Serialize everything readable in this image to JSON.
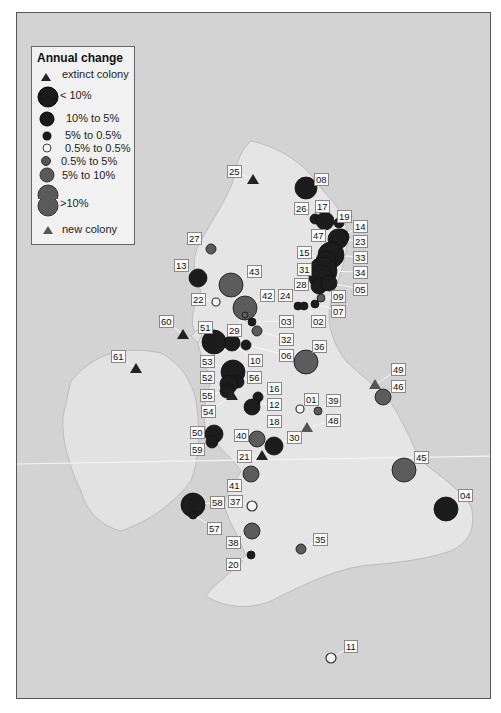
{
  "legend": {
    "title": "Annual change",
    "items": [
      {
        "label": "extinct colony",
        "symbol": "triangle",
        "color": "#222222"
      },
      {
        "label": "< 10%",
        "symbol": "circle",
        "size": 18,
        "color": "#1a1a1a"
      },
      {
        "label": "10% to  5%",
        "symbol": "circle",
        "size": 13,
        "color": "#1a1a1a"
      },
      {
        "label": "5% to  0.5%",
        "symbol": "circle",
        "size": 8,
        "color": "#1a1a1a"
      },
      {
        "label": "0.5% to 0.5%",
        "symbol": "circle",
        "size": 8,
        "color": "#ffffff"
      },
      {
        "label": "0.5% to 5%",
        "symbol": "circle",
        "size": 8,
        "color": "#555555"
      },
      {
        "label": "5% to 10%",
        "symbol": "circle",
        "size": 13,
        "color": "#555555"
      },
      {
        "label": ">10%",
        "symbol": "circle",
        "size": 18,
        "color": "#555555"
      },
      {
        "label": "new colony",
        "symbol": "triangle",
        "color": "#555555"
      }
    ]
  },
  "colonies": [
    {
      "id": "08",
      "x": 305,
      "y": 187,
      "r": 11,
      "cls": "dark",
      "lx": 313,
      "ly": 172
    },
    {
      "id": "25",
      "x": 252,
      "y": 179,
      "cls": "tri-dark",
      "lx": 226,
      "ly": 164
    },
    {
      "id": "26",
      "x": 314,
      "y": 218,
      "r": 5,
      "cls": "dark",
      "lx": 293,
      "ly": 201
    },
    {
      "id": "17",
      "x": 324,
      "y": 220,
      "r": 9,
      "cls": "dark",
      "lx": 314,
      "ly": 199
    },
    {
      "id": "19",
      "x": 338,
      "y": 222,
      "r": 5,
      "cls": "dark",
      "lx": 336,
      "ly": 209
    },
    {
      "id": "14",
      "x": 340,
      "y": 236,
      "r": 8,
      "cls": "dark",
      "lx": 352,
      "ly": 219
    },
    {
      "id": "47",
      "x": 320,
      "y": 236,
      "r": 3,
      "cls": "dark",
      "lx": 310,
      "ly": 228
    },
    {
      "id": "23",
      "x": 337,
      "y": 238,
      "r": 10,
      "cls": "dark",
      "lx": 352,
      "ly": 234
    },
    {
      "id": "33",
      "x": 330,
      "y": 254,
      "r": 13,
      "cls": "dark",
      "lx": 352,
      "ly": 250
    },
    {
      "id": "15",
      "x": 325,
      "y": 260,
      "r": 10,
      "cls": "dark",
      "lx": 296,
      "ly": 245
    },
    {
      "id": "34",
      "x": 322,
      "y": 270,
      "r": 14,
      "cls": "dark",
      "lx": 352,
      "ly": 265
    },
    {
      "id": "31",
      "x": 320,
      "y": 276,
      "r": 12,
      "cls": "dark",
      "lx": 296,
      "ly": 262
    },
    {
      "id": "28",
      "x": 318,
      "y": 285,
      "r": 8,
      "cls": "dark",
      "lx": 293,
      "ly": 277
    },
    {
      "id": "05",
      "x": 328,
      "y": 282,
      "r": 8,
      "cls": "dark",
      "lx": 352,
      "ly": 282
    },
    {
      "id": "09",
      "x": 320,
      "y": 297,
      "r": 4,
      "cls": "grey",
      "lx": 330,
      "ly": 289
    },
    {
      "id": "07",
      "x": 314,
      "y": 303,
      "r": 4,
      "cls": "dark",
      "lx": 330,
      "ly": 304
    },
    {
      "id": "24",
      "x": 297,
      "y": 305,
      "r": 4,
      "cls": "dark",
      "lx": 277,
      "ly": 288
    },
    {
      "id": "02",
      "x": 303,
      "y": 305,
      "r": 4,
      "cls": "dark",
      "lx": 310,
      "ly": 314
    },
    {
      "id": "27",
      "x": 210,
      "y": 248,
      "r": 5,
      "cls": "grey",
      "lx": 186,
      "ly": 231
    },
    {
      "id": "13",
      "x": 197,
      "y": 277,
      "r": 9,
      "cls": "dark",
      "lx": 173,
      "ly": 258
    },
    {
      "id": "43",
      "x": 230,
      "y": 284,
      "r": 12,
      "cls": "grey",
      "lx": 246,
      "ly": 264
    },
    {
      "id": "22",
      "x": 215,
      "y": 301,
      "r": 4,
      "cls": "white",
      "lx": 190,
      "ly": 292
    },
    {
      "id": "42",
      "x": 244,
      "y": 307,
      "r": 12,
      "cls": "grey",
      "lx": 259,
      "ly": 288
    },
    {
      "id": "29",
      "x": 244,
      "y": 314,
      "r": 3,
      "cls": "grey",
      "lx": 226,
      "ly": 323
    },
    {
      "id": "03",
      "x": 251,
      "y": 321,
      "r": 4,
      "cls": "dark",
      "lx": 278,
      "ly": 314
    },
    {
      "id": "32",
      "x": 256,
      "y": 330,
      "r": 5,
      "cls": "grey",
      "lx": 278,
      "ly": 332
    },
    {
      "id": "06",
      "x": 245,
      "y": 344,
      "r": 5,
      "cls": "dark",
      "lx": 278,
      "ly": 348
    },
    {
      "id": "51",
      "x": 213,
      "y": 341,
      "r": 12,
      "cls": "dark",
      "lx": 197,
      "ly": 320
    },
    {
      "id": "10",
      "x": 231,
      "y": 342,
      "r": 8,
      "cls": "dark",
      "lx": 247,
      "ly": 353
    },
    {
      "id": "60",
      "x": 182,
      "y": 334,
      "cls": "tri-dark",
      "lx": 158,
      "ly": 314
    },
    {
      "id": "61",
      "x": 135,
      "y": 368,
      "cls": "tri-dark",
      "lx": 110,
      "ly": 349
    },
    {
      "id": "36",
      "x": 305,
      "y": 361,
      "r": 12,
      "cls": "grey",
      "lx": 311,
      "ly": 339
    },
    {
      "id": "53",
      "x": 232,
      "y": 371,
      "r": 12,
      "cls": "dark",
      "lx": 199,
      "ly": 354
    },
    {
      "id": "56",
      "x": 237,
      "y": 381,
      "r": 6,
      "cls": "dark",
      "lx": 246,
      "ly": 370
    },
    {
      "id": "52",
      "x": 228,
      "y": 383,
      "r": 9,
      "cls": "dark",
      "lx": 199,
      "ly": 370
    },
    {
      "id": "55",
      "x": 226,
      "y": 390,
      "r": 7,
      "cls": "dark",
      "lx": 199,
      "ly": 388
    },
    {
      "id": "54",
      "x": 231,
      "y": 395,
      "cls": "tri-dark",
      "lx": 200,
      "ly": 404
    },
    {
      "id": "16",
      "x": 257,
      "y": 396,
      "r": 5,
      "cls": "dark",
      "lx": 266,
      "ly": 381
    },
    {
      "id": "12",
      "x": 255,
      "y": 402,
      "r": 4,
      "cls": "dark",
      "lx": 266,
      "ly": 397
    },
    {
      "id": "18",
      "x": 251,
      "y": 406,
      "r": 8,
      "cls": "dark",
      "lx": 266,
      "ly": 414
    },
    {
      "id": "01",
      "x": 299,
      "y": 408,
      "r": 4,
      "cls": "white",
      "lx": 303,
      "ly": 392
    },
    {
      "id": "39",
      "x": 317,
      "y": 410,
      "r": 4,
      "cls": "grey",
      "lx": 325,
      "ly": 393
    },
    {
      "id": "48",
      "x": 306,
      "y": 427,
      "cls": "tri-grey",
      "lx": 325,
      "ly": 413
    },
    {
      "id": "49",
      "x": 374,
      "y": 384,
      "cls": "tri-grey",
      "lx": 390,
      "ly": 362
    },
    {
      "id": "46",
      "x": 382,
      "y": 396,
      "r": 8,
      "cls": "grey",
      "lx": 390,
      "ly": 379
    },
    {
      "id": "50",
      "x": 213,
      "y": 433,
      "r": 9,
      "cls": "dark",
      "lx": 189,
      "ly": 425
    },
    {
      "id": "59",
      "x": 211,
      "y": 441,
      "r": 6,
      "cls": "dark",
      "lx": 189,
      "ly": 442
    },
    {
      "id": "40",
      "x": 256,
      "y": 438,
      "r": 8,
      "cls": "grey",
      "lx": 233,
      "ly": 428
    },
    {
      "id": "30",
      "x": 273,
      "y": 445,
      "r": 9,
      "cls": "dark",
      "lx": 286,
      "ly": 430
    },
    {
      "id": "21",
      "x": 261,
      "y": 455,
      "cls": "tri-dark",
      "lx": 236,
      "ly": 449
    },
    {
      "id": "45",
      "x": 403,
      "y": 469,
      "r": 12,
      "cls": "grey",
      "lx": 413,
      "ly": 450
    },
    {
      "id": "04",
      "x": 445,
      "y": 508,
      "r": 12,
      "cls": "dark",
      "lx": 457,
      "ly": 488
    },
    {
      "id": "41",
      "x": 250,
      "y": 473,
      "r": 8,
      "cls": "grey",
      "lx": 226,
      "ly": 478
    },
    {
      "id": "58",
      "x": 192,
      "y": 504,
      "r": 12,
      "cls": "dark",
      "lx": 209,
      "ly": 495
    },
    {
      "id": "57",
      "x": 192,
      "y": 514,
      "r": 4,
      "cls": "dark",
      "lx": 206,
      "ly": 521
    },
    {
      "id": "37",
      "x": 251,
      "y": 505,
      "r": 5,
      "cls": "white",
      "lx": 227,
      "ly": 494
    },
    {
      "id": "38",
      "x": 251,
      "y": 530,
      "r": 8,
      "cls": "grey",
      "lx": 225,
      "ly": 535
    },
    {
      "id": "35",
      "x": 300,
      "y": 548,
      "r": 5,
      "cls": "grey",
      "lx": 312,
      "ly": 532
    },
    {
      "id": "20",
      "x": 250,
      "y": 554,
      "r": 4,
      "cls": "dark",
      "lx": 225,
      "ly": 557
    },
    {
      "id": "11",
      "x": 330,
      "y": 657,
      "r": 5,
      "cls": "white",
      "lx": 343,
      "ly": 639
    }
  ]
}
